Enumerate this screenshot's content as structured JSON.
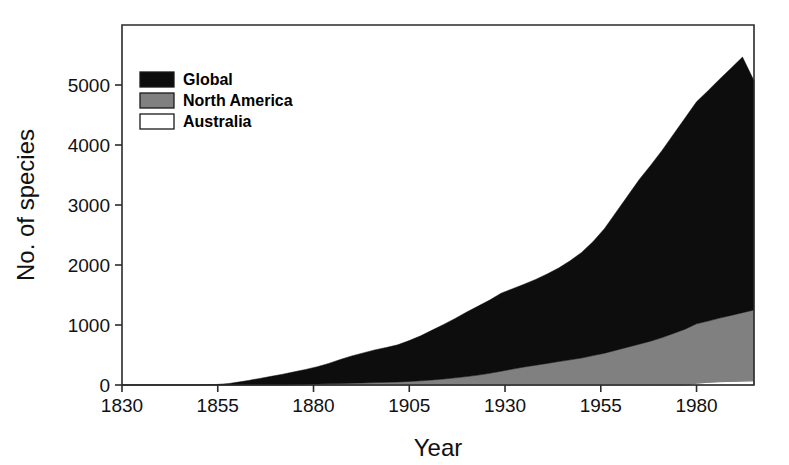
{
  "chart_data": {
    "type": "area",
    "stacked": true,
    "title": "",
    "subtitle": "",
    "xlabel": "Year",
    "ylabel": "No. of species",
    "xlim": [
      1830,
      1995
    ],
    "ylim": [
      0,
      6000
    ],
    "xticks": [
      1830,
      1855,
      1880,
      1905,
      1930,
      1955,
      1980
    ],
    "yticks": [
      0,
      1000,
      2000,
      3000,
      4000,
      5000
    ],
    "xtick_labels": [
      "1830",
      "1855",
      "1880",
      "1905",
      "1930",
      "1955",
      "1980"
    ],
    "ytick_labels": [
      "0",
      "1000",
      "2000",
      "3000",
      "4000",
      "5000"
    ],
    "grid": false,
    "legend_position": "top-left",
    "legend_entries": [
      {
        "label": "Global",
        "color": "#0d0d0d"
      },
      {
        "label": "North America",
        "color": "#808080"
      },
      {
        "label": "Australia",
        "color": "#ffffff"
      }
    ],
    "x": [
      1830,
      1835,
      1840,
      1845,
      1850,
      1855,
      1858,
      1860,
      1863,
      1866,
      1869,
      1872,
      1875,
      1878,
      1881,
      1884,
      1887,
      1890,
      1893,
      1896,
      1899,
      1902,
      1905,
      1908,
      1911,
      1914,
      1917,
      1920,
      1923,
      1926,
      1929,
      1932,
      1935,
      1938,
      1941,
      1944,
      1947,
      1950,
      1953,
      1956,
      1959,
      1962,
      1965,
      1968,
      1971,
      1974,
      1977,
      1980,
      1983,
      1986,
      1989,
      1992,
      1995
    ],
    "series": [
      {
        "name": "Australia",
        "color": "#ffffff",
        "values": [
          0,
          0,
          0,
          0,
          0,
          0,
          0,
          0,
          0,
          0,
          0,
          0,
          0,
          0,
          0,
          0,
          0,
          0,
          0,
          0,
          0,
          0,
          0,
          0,
          0,
          0,
          0,
          0,
          0,
          0,
          0,
          0,
          0,
          0,
          0,
          0,
          0,
          0,
          0,
          0,
          0,
          0,
          0,
          0,
          0,
          0,
          0,
          30,
          45,
          55,
          60,
          65,
          70
        ]
      },
      {
        "name": "North America",
        "color": "#808080",
        "values": [
          0,
          0,
          0,
          0,
          0,
          0,
          0,
          0,
          0,
          0,
          0,
          0,
          5,
          10,
          15,
          20,
          25,
          30,
          35,
          40,
          45,
          50,
          60,
          70,
          85,
          100,
          120,
          140,
          165,
          195,
          230,
          265,
          300,
          330,
          360,
          390,
          420,
          450,
          490,
          530,
          580,
          630,
          680,
          730,
          790,
          860,
          930,
          990,
          1020,
          1060,
          1100,
          1140,
          1180
        ]
      },
      {
        "name": "Global",
        "color": "#0d0d0d",
        "values": [
          0,
          0,
          0,
          0,
          0,
          10,
          25,
          45,
          75,
          110,
          145,
          180,
          215,
          250,
          290,
          340,
          400,
          455,
          500,
          545,
          580,
          620,
          680,
          750,
          830,
          910,
          990,
          1075,
          1150,
          1220,
          1300,
          1340,
          1380,
          1430,
          1490,
          1560,
          1650,
          1760,
          1900,
          2080,
          2300,
          2520,
          2740,
          2930,
          3120,
          3320,
          3520,
          3700,
          3840,
          3980,
          4120,
          4260,
          3820
        ]
      }
    ],
    "totals": [
      0,
      0,
      0,
      0,
      0,
      10,
      25,
      45,
      75,
      110,
      145,
      180,
      220,
      260,
      305,
      360,
      425,
      485,
      535,
      585,
      625,
      670,
      740,
      820,
      915,
      1010,
      1110,
      1215,
      1315,
      1415,
      1530,
      1605,
      1680,
      1760,
      1850,
      1950,
      2070,
      2210,
      2390,
      2610,
      2880,
      3150,
      3420,
      3660,
      3910,
      4180,
      4450,
      4720,
      4905,
      5095,
      5280,
      5465,
      5070
    ]
  }
}
